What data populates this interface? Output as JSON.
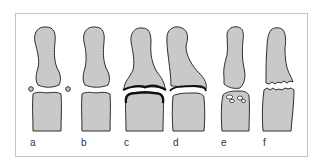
{
  "figure": {
    "frame_border_color": "#c4c4c4",
    "bone_fill": "#c9c9c9",
    "bone_outline": "#2e2e2e",
    "panels": [
      {
        "label": "a",
        "feature": "small round bodies beside joint space"
      },
      {
        "label": "b",
        "feature": "normal joint space"
      },
      {
        "label": "c",
        "feature": "thick dark lines along joint surfaces"
      },
      {
        "label": "d",
        "feature": "dark line along joint surface, deviated distal bone"
      },
      {
        "label": "e",
        "feature": "cystic lucencies in proximal bone head"
      },
      {
        "label": "f",
        "feature": "jagged irregular fracture-like joint margins"
      }
    ]
  }
}
